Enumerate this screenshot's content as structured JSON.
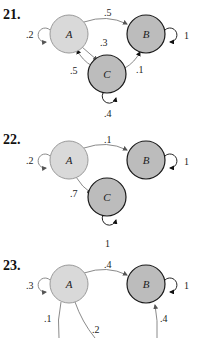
{
  "diagrams": [
    {
      "number": "21.",
      "nodes": [
        {
          "id": "A",
          "label": "A",
          "fill": "#d9d9d9",
          "stroke": "#9a9a9a"
        },
        {
          "id": "B",
          "label": "B",
          "fill": "#bcbcbc",
          "stroke": "#1a1a1a"
        },
        {
          "id": "C",
          "label": "C",
          "fill": "#bcbcbc",
          "stroke": "#1a1a1a"
        }
      ],
      "edges": [
        {
          "from": "A",
          "to": "A",
          "label": ".2"
        },
        {
          "from": "A",
          "to": "B",
          "label": ".5"
        },
        {
          "from": "A",
          "to": "C",
          "label": ".3"
        },
        {
          "from": "C",
          "to": "A",
          "label": ".5"
        },
        {
          "from": "C",
          "to": "B",
          "label": ".1"
        },
        {
          "from": "C",
          "to": "C",
          "label": ".4"
        },
        {
          "from": "B",
          "to": "B",
          "label": "1"
        }
      ]
    },
    {
      "number": "22.",
      "nodes": [
        {
          "id": "A",
          "label": "A",
          "fill": "#d9d9d9",
          "stroke": "#9a9a9a"
        },
        {
          "id": "B",
          "label": "B",
          "fill": "#bcbcbc",
          "stroke": "#1a1a1a"
        },
        {
          "id": "C",
          "label": "C",
          "fill": "#bcbcbc",
          "stroke": "#1a1a1a"
        }
      ],
      "edges": [
        {
          "from": "A",
          "to": "A",
          "label": ".2"
        },
        {
          "from": "A",
          "to": "B",
          "label": ".1"
        },
        {
          "from": "A",
          "to": "C",
          "label": ".7"
        },
        {
          "from": "B",
          "to": "B",
          "label": "1"
        },
        {
          "from": "C",
          "to": "C",
          "label": "1"
        }
      ]
    },
    {
      "number": "23.",
      "nodes": [
        {
          "id": "A",
          "label": "A",
          "fill": "#d9d9d9",
          "stroke": "#9a9a9a"
        },
        {
          "id": "B",
          "label": "B",
          "fill": "#bcbcbc",
          "stroke": "#1a1a1a"
        }
      ],
      "edges": [
        {
          "from": "A",
          "to": "A",
          "label": ".3"
        },
        {
          "from": "A",
          "to": "B",
          "label": ".4"
        },
        {
          "from": "B",
          "to": "B",
          "label": "1"
        },
        {
          "from": "A",
          "to": "?",
          "label": ".1"
        },
        {
          "from": "A",
          "to": "?",
          "label": ".2"
        },
        {
          "from": "?",
          "to": "B",
          "label": ".4"
        }
      ]
    }
  ]
}
